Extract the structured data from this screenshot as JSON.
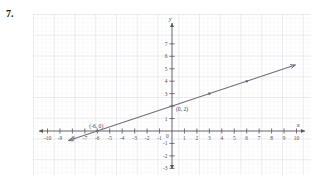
{
  "problem": {
    "number": "7."
  },
  "graph": {
    "axis_labels": {
      "x": "x",
      "y": "y"
    },
    "x_ticks": [
      {
        "value": -10,
        "label": "-10"
      },
      {
        "value": -9,
        "label": "-9"
      },
      {
        "value": -8,
        "label": "-8"
      },
      {
        "value": -7,
        "label": "-7"
      },
      {
        "value": -6,
        "label": "-6"
      },
      {
        "value": -5,
        "label": "-5"
      },
      {
        "value": -4,
        "label": "-4"
      },
      {
        "value": -3,
        "label": "-3"
      },
      {
        "value": -2,
        "label": "-2"
      },
      {
        "value": -1,
        "label": "-1"
      },
      {
        "value": 1,
        "label": "1"
      },
      {
        "value": 2,
        "label": "2"
      },
      {
        "value": 3,
        "label": "3"
      },
      {
        "value": 4,
        "label": "4"
      },
      {
        "value": 5,
        "label": "5"
      },
      {
        "value": 6,
        "label": "6"
      },
      {
        "value": 7,
        "label": "7"
      },
      {
        "value": 8,
        "label": "8"
      },
      {
        "value": 9,
        "label": "9"
      },
      {
        "value": 10,
        "label": "10"
      }
    ],
    "y_ticks": [
      {
        "value": 7,
        "label": "7"
      },
      {
        "value": 6,
        "label": "6"
      },
      {
        "value": 5,
        "label": "5"
      },
      {
        "value": 4,
        "label": "4"
      },
      {
        "value": 3,
        "label": "3"
      },
      {
        "value": 2,
        "label": ""
      },
      {
        "value": 1,
        "label": "1"
      },
      {
        "value": -1,
        "label": "-1"
      },
      {
        "value": -2,
        "label": "-2"
      },
      {
        "value": -3,
        "label": "-3"
      }
    ],
    "origin_label": "0",
    "point_labels": [
      {
        "text": "(0, 2)",
        "x": 0,
        "y": 2
      },
      {
        "text": "(-6, 0)",
        "x": -6,
        "y": 0
      }
    ],
    "colors": {
      "grid_minor": "#e3e3ea",
      "grid_major": "#d0d0da",
      "axis": "#55555f",
      "line": "#6f6f7c",
      "text": "#45454f"
    }
  },
  "chart_data": {
    "type": "line",
    "title": "",
    "xlabel": "x",
    "ylabel": "y",
    "xlim": [
      -11,
      11
    ],
    "ylim": [
      -3.5,
      7.8
    ],
    "grid": true,
    "legend": "none",
    "series": [
      {
        "name": "line",
        "equation": "y = x/3 + 2",
        "slope": 0.3333,
        "intercept": 2,
        "arrows": "both",
        "points": [
          {
            "x": -9,
            "y": -1
          },
          {
            "x": -6,
            "y": 0
          },
          {
            "x": -3,
            "y": 1
          },
          {
            "x": 0,
            "y": 2
          },
          {
            "x": 3,
            "y": 3
          },
          {
            "x": 6,
            "y": 4
          },
          {
            "x": 9,
            "y": 5
          }
        ],
        "marked_points": [
          {
            "x": -6,
            "y": 0,
            "label": "(-6, 0)"
          },
          {
            "x": 0,
            "y": 2,
            "label": "(0, 2)"
          },
          {
            "x": 3,
            "y": 3,
            "label": ""
          },
          {
            "x": 6,
            "y": 4,
            "label": ""
          }
        ]
      }
    ]
  }
}
